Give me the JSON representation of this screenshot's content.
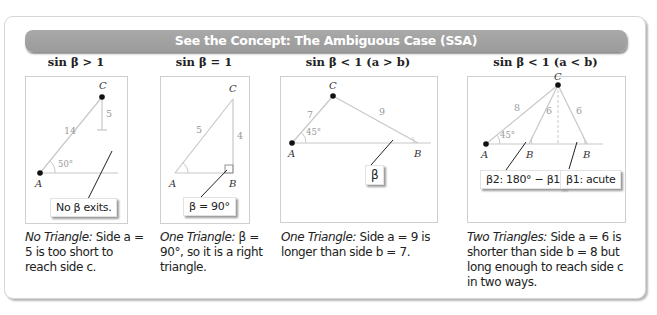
{
  "header": {
    "title": "See the Concept: The Ambiguous Case (SSA)"
  },
  "colors": {
    "header_bar": "#a3a3a3",
    "header_text": "#ffffff",
    "line": "#c8c8c8",
    "point": "#111111",
    "label_gray": "#9a9a9a"
  },
  "columns": [
    {
      "title": "sin β > 1",
      "diagram": {
        "points": [
          "A",
          "C"
        ],
        "sides": [
          "14",
          "5"
        ],
        "angle": "50°",
        "callout": "No β exits."
      },
      "caption": {
        "lead": "No Triangle:",
        "text": " Side a = 5 is too short to reach side c."
      }
    },
    {
      "title": "sin β = 1",
      "diagram": {
        "points": [
          "A",
          "B",
          "C"
        ],
        "sides": [
          "5",
          "4"
        ],
        "callout": "β = 90°"
      },
      "caption": {
        "lead": "One Triangle:",
        "text": " β = 90°, so it is a right triangle."
      }
    },
    {
      "title": "sin β < 1 (a > b)",
      "diagram": {
        "points": [
          "A",
          "B",
          "C"
        ],
        "sides": [
          "7",
          "9"
        ],
        "angle": "45°",
        "callout": "β"
      },
      "caption": {
        "lead": "One Triangle:",
        "text": " Side a = 9 is longer than side b = 7."
      }
    },
    {
      "title": "sin β < 1 (a < b)",
      "diagram": {
        "points": [
          "A",
          "B",
          "B",
          "C"
        ],
        "sides": [
          "8",
          "6",
          "6"
        ],
        "angle": "45°",
        "callouts": [
          "β2: 180° − β1",
          "β1: acute"
        ]
      },
      "caption": {
        "lead": "Two Triangles:",
        "text": " Side a = 6 is shorter than side b = 8 but long enough to reach side c in two ways."
      }
    }
  ]
}
